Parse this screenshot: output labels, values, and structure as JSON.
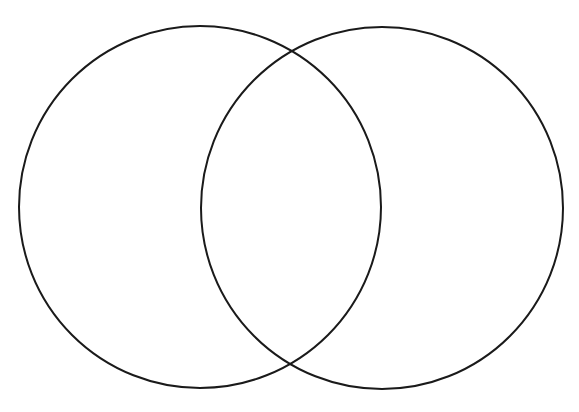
{
  "diagram": {
    "type": "venn",
    "sets": 2,
    "background": "#ffffff",
    "stroke_color": "#1a1a1a",
    "stroke_width": 2,
    "circles": [
      {
        "name": "left-circle",
        "cx": 200,
        "cy": 207,
        "r": 181,
        "label": ""
      },
      {
        "name": "right-circle",
        "cx": 382,
        "cy": 208,
        "r": 181,
        "label": ""
      }
    ],
    "regions": {
      "left_only": "",
      "intersection": "",
      "right_only": ""
    }
  }
}
